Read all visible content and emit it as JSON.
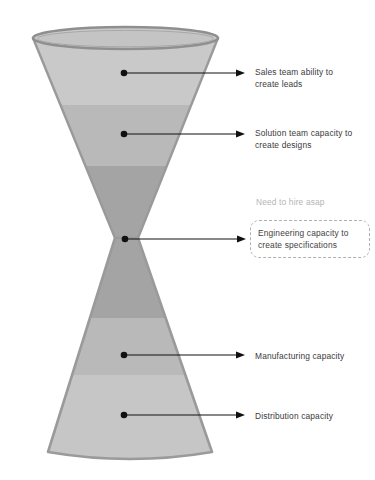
{
  "diagram": {
    "background_color": "#ffffff",
    "shape": {
      "name": "double-cone-hourglass",
      "outline_color": "#9a9a9a",
      "rim_color": "#8f8f8f"
    },
    "bands": [
      {
        "id": "band-1",
        "label": "Sales team ability to create leads",
        "color": "#c9c9c9"
      },
      {
        "id": "band-2",
        "label": "Solution team capacity to create designs",
        "color": "#b9b9b9"
      },
      {
        "id": "band-3",
        "label": "Engineering capacity to create specifications",
        "color": "#a4a4a4"
      },
      {
        "id": "band-4",
        "label": "Manufacturing capacity",
        "color": "#b9b9b9"
      },
      {
        "id": "band-5",
        "label": "Distribution capacity",
        "color": "#c6c6c6"
      }
    ],
    "callouts": [
      {
        "id": "callout-sales",
        "text": "Sales team ability to\ncreate leads",
        "highlighted": false
      },
      {
        "id": "callout-solution",
        "text": "Solution team capacity to\ncreate designs",
        "highlighted": false
      },
      {
        "id": "callout-engineering",
        "text": "Engineering capacity to\ncreate specifications",
        "note": "Need to hire asap",
        "highlighted": true,
        "note_color": "#b5b5b5",
        "box_border_color": "#b0b0b0"
      },
      {
        "id": "callout-manufacturing",
        "text": "Manufacturing capacity",
        "highlighted": false
      },
      {
        "id": "callout-distribution",
        "text": "Distribution capacity",
        "highlighted": false
      }
    ],
    "connector": {
      "line_color": "#111111",
      "dot_color": "#111111",
      "arrow_color": "#111111"
    }
  }
}
